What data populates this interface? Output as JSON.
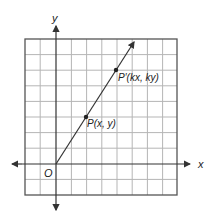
{
  "diagram": {
    "type": "coordinate-grid-dilation",
    "axes": {
      "x_label": "x",
      "y_label": "y",
      "origin_label": "O"
    },
    "grid": {
      "columns": 10,
      "rows": 10
    },
    "points": [
      {
        "label": "P(x, y)",
        "grid_x": 2,
        "grid_y": 3
      },
      {
        "label": "P′(kx, ky)",
        "grid_x": 4,
        "grid_y": 6
      }
    ],
    "line": {
      "description": "ray from origin through P and P′"
    },
    "colors": {
      "grid": "#b5b5b5",
      "border": "#555555",
      "axis": "#333333",
      "line": "#333333"
    }
  }
}
